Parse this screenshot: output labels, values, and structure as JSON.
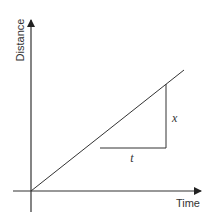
{
  "diagram": {
    "x_axis": {
      "label": "Time"
    },
    "y_axis": {
      "label": "Distance"
    },
    "gradient_triangle": {
      "vertical_label": "x",
      "horizontal_label": "t"
    },
    "colors": {
      "line": "#333333",
      "background": "#ffffff"
    }
  }
}
